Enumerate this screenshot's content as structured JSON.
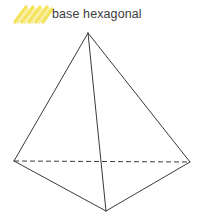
{
  "canvas": {
    "width": 206,
    "height": 224,
    "background_color": "#ffffff"
  },
  "annotation": {
    "label": "base hexagonal",
    "text_color": "#3c3c3c",
    "highlight": {
      "icon_name": "highlighter-scribble-icon",
      "color": "#f5e35c",
      "stroke_count": 5,
      "angle_deg": -52
    }
  },
  "figure": {
    "name": "pyramid",
    "line_color": "#3a3a3a",
    "line_width": 1,
    "dashed_pattern": "5,3",
    "vertices": {
      "apex": [
        88,
        33
      ],
      "left": [
        14,
        161
      ],
      "right": [
        190,
        162
      ],
      "front": [
        106,
        211
      ]
    },
    "solid_edges": [
      [
        "apex",
        "left"
      ],
      [
        "apex",
        "right"
      ],
      [
        "apex",
        "front"
      ],
      [
        "left",
        "front"
      ],
      [
        "right",
        "front"
      ]
    ],
    "hidden_edges": [
      [
        "left",
        "right"
      ]
    ]
  }
}
